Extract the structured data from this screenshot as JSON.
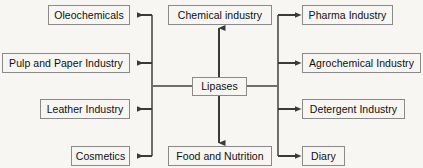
{
  "diagram": {
    "type": "radial-flow",
    "background_color": "#f7f6f2",
    "box_border_color": "#8a8a8a",
    "text_color": "#101010",
    "connector_color": "#6e6e6e",
    "center": {
      "label": "Lipases",
      "x": 192,
      "y": 77,
      "width": 55,
      "height": 19
    },
    "nodes": {
      "left": [
        {
          "label": "Oleochemicals",
          "x": 48,
          "y": 5,
          "width": 82,
          "height": 20
        },
        {
          "label": "Pulp and Paper Industry",
          "x": 2,
          "y": 53,
          "width": 128,
          "height": 20
        },
        {
          "label": "Leather Industry",
          "x": 40,
          "y": 99,
          "width": 90,
          "height": 20
        },
        {
          "label": "Cosmetics",
          "x": 71,
          "y": 146,
          "width": 59,
          "height": 20
        }
      ],
      "right": [
        {
          "label": "Pharma Industry",
          "x": 302,
          "y": 5,
          "width": 91,
          "height": 20
        },
        {
          "label": "Agrochemical Industry",
          "x": 302,
          "y": 53,
          "width": 119,
          "height": 20
        },
        {
          "label": "Detergent Industry",
          "x": 302,
          "y": 99,
          "width": 103,
          "height": 20
        },
        {
          "label": "Diary",
          "x": 302,
          "y": 146,
          "width": 43,
          "height": 20
        }
      ],
      "top": {
        "label": "Chemical industry",
        "x": 168,
        "y": 5,
        "width": 104,
        "height": 20
      },
      "bottom": {
        "label": "Food and Nutrition",
        "x": 168,
        "y": 146,
        "width": 104,
        "height": 20
      }
    },
    "connectors": {
      "left_spine_x": 152,
      "right_spine_x": 278,
      "spine_top_y": 15,
      "spine_bottom_y": 156,
      "hub_y": 86,
      "vertical_x": 219,
      "branch_y_values": [
        15,
        63,
        109,
        156
      ]
    }
  }
}
